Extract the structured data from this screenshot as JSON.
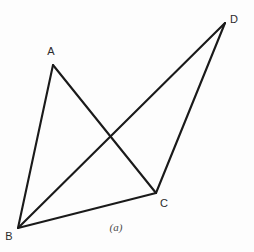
{
  "figure": {
    "caption": "(a)",
    "caption_position": {
      "x": 116,
      "y": 227
    },
    "stroke_color": "#1a1a1a",
    "background_color": "#fdfdfd",
    "label_color": "#2b2b2b",
    "stroke_width": 2.1,
    "width": 254,
    "height": 252
  },
  "vertices": [
    {
      "id": "A",
      "label": "A",
      "x": 53,
      "y": 65,
      "label_x": 51,
      "label_y": 51
    },
    {
      "id": "B",
      "label": "B",
      "x": 18,
      "y": 228,
      "label_x": 9,
      "label_y": 236
    },
    {
      "id": "C",
      "label": "C",
      "x": 156,
      "y": 193,
      "label_x": 164,
      "label_y": 203
    },
    {
      "id": "D",
      "label": "D",
      "x": 225,
      "y": 23,
      "label_x": 234,
      "label_y": 19
    }
  ],
  "edges": [
    {
      "id": "AB",
      "from": "A",
      "to": "B",
      "x1": 53,
      "y1": 65,
      "x2": 18,
      "y2": 228
    },
    {
      "id": "AC",
      "from": "A",
      "to": "C",
      "x1": 53,
      "y1": 65,
      "x2": 156,
      "y2": 193
    },
    {
      "id": "BC",
      "from": "B",
      "to": "C",
      "x1": 18,
      "y1": 228,
      "x2": 156,
      "y2": 193
    },
    {
      "id": "BD",
      "from": "B",
      "to": "D",
      "x1": 18,
      "y1": 228,
      "x2": 225,
      "y2": 23
    },
    {
      "id": "CD",
      "from": "C",
      "to": "D",
      "x1": 156,
      "y1": 193,
      "x2": 225,
      "y2": 23
    }
  ],
  "intersections": [
    {
      "id": "AC-BD",
      "edges": "AC x BD",
      "x": 108,
      "y": 137
    }
  ]
}
